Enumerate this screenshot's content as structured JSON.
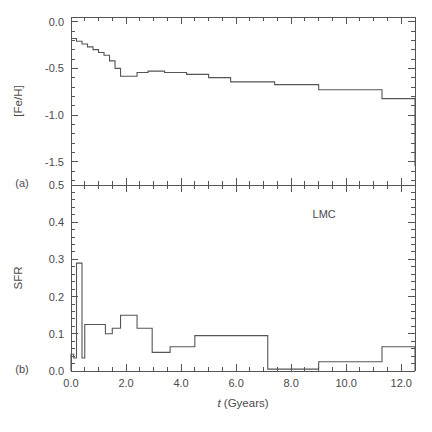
{
  "figure": {
    "xlabel": "t (Gyears)",
    "annotation": "LMC",
    "panel_a_label": "(a)",
    "panel_b_label": "(b)",
    "line_color": "#555555",
    "axis_color": "#555555"
  },
  "chart_data": [
    {
      "type": "line",
      "panel": "a",
      "title": "",
      "xlabel": "t (Gyears)",
      "ylabel": "[Fe/H]",
      "xlim": [
        0.0,
        12.5
      ],
      "ylim": [
        -1.75,
        0.05
      ],
      "xticks": [
        0.0,
        2.0,
        4.0,
        6.0,
        8.0,
        10.0,
        12.0
      ],
      "xticklabels": [
        "",
        "",
        "",
        "",
        "",
        "",
        ""
      ],
      "yticks": [
        0.0,
        -0.5,
        -1.0,
        -1.5
      ],
      "yticklabels": [
        "0.0",
        "-0.5",
        "-1.0",
        "-1.5"
      ],
      "grid": false,
      "legend": null,
      "drawstyle": "steps-post",
      "x": [
        0.0,
        0.2,
        0.4,
        0.6,
        0.8,
        1.0,
        1.2,
        1.4,
        1.6,
        1.8,
        2.0,
        2.4,
        2.8,
        3.4,
        4.2,
        5.0,
        5.8,
        6.6,
        7.4,
        8.2,
        9.0,
        10.0,
        11.3,
        12.5
      ],
      "y": [
        -0.18,
        -0.21,
        -0.24,
        -0.27,
        -0.3,
        -0.33,
        -0.36,
        -0.42,
        -0.5,
        -0.585,
        -0.585,
        -0.545,
        -0.53,
        -0.545,
        -0.565,
        -0.6,
        -0.645,
        -0.645,
        -0.675,
        -0.675,
        -0.73,
        -0.73,
        -0.825,
        -1.55
      ],
      "series": [
        {
          "name": "[Fe/H]",
          "values": [
            -0.18,
            -0.21,
            -0.24,
            -0.27,
            -0.3,
            -0.33,
            -0.36,
            -0.42,
            -0.5,
            -0.585,
            -0.585,
            -0.545,
            -0.53,
            -0.545,
            -0.565,
            -0.6,
            -0.645,
            -0.645,
            -0.675,
            -0.675,
            -0.73,
            -0.73,
            -0.825,
            -1.55
          ]
        }
      ]
    },
    {
      "type": "bar",
      "panel": "b",
      "title": "",
      "xlabel": "t (Gyears)",
      "ylabel": "SFR",
      "xlim": [
        0.0,
        12.5
      ],
      "ylim": [
        0.0,
        0.5
      ],
      "xticks": [
        0.0,
        2.0,
        4.0,
        6.0,
        8.0,
        10.0,
        12.0
      ],
      "xticklabels": [
        "0.0",
        "2.0",
        "4.0",
        "6.0",
        "8.0",
        "10.0",
        "12.0"
      ],
      "yticks": [
        0.0,
        0.1,
        0.2,
        0.3,
        0.4,
        0.5
      ],
      "yticklabels": [
        "0.0",
        "0.1",
        "0.2",
        "0.3",
        "0.4",
        "0.5"
      ],
      "grid": false,
      "legend": null,
      "drawstyle": "steps-post",
      "bin_edges": [
        0.0,
        0.1,
        0.2,
        0.3,
        0.4,
        0.5,
        0.65,
        1.25,
        1.5,
        1.8,
        2.05,
        2.4,
        2.95,
        3.6,
        4.5,
        5.65,
        7.15,
        9.0,
        11.3,
        12.5
      ],
      "values": [
        0.045,
        0.035,
        0.29,
        0.29,
        0.035,
        0.125,
        0.125,
        0.1,
        0.115,
        0.15,
        0.15,
        0.115,
        0.05,
        0.065,
        0.095,
        0.095,
        0.005,
        0.025,
        0.065
      ],
      "categories": [
        "0.0-0.1",
        "0.1-0.2",
        "0.2-0.3",
        "0.3-0.4",
        "0.4-0.5",
        "0.5-0.65",
        "0.65-1.25",
        "1.25-1.5",
        "1.5-1.8",
        "1.8-2.05",
        "2.05-2.4",
        "2.4-2.95",
        "2.95-3.6",
        "3.6-4.5",
        "4.5-5.65",
        "5.65-7.15",
        "7.15-9.0",
        "9.0-11.3",
        "11.3-12.5"
      ],
      "annotations": [
        {
          "text": "LMC",
          "x": 9.2,
          "y": 0.41
        }
      ]
    }
  ]
}
